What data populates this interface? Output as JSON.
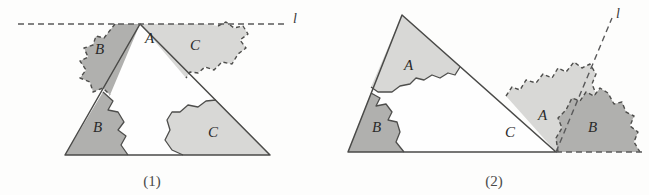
{
  "figure": {
    "background_color": "#fdfdfc",
    "shade_dark": "#b0b0ae",
    "shade_light": "#d8d8d6",
    "stroke_color": "#4a4a48",
    "panels": [
      {
        "id": "panel-1",
        "caption": "(1)",
        "line_label": "l",
        "line_orientation": "horizontal",
        "labels": [
          {
            "text": "A",
            "role": "apex-interior-label"
          },
          {
            "text": "B",
            "role": "upper-left-region-label"
          },
          {
            "text": "C",
            "role": "upper-right-region-label"
          },
          {
            "text": "B",
            "role": "lower-left-region-label"
          },
          {
            "text": "C",
            "role": "lower-right-region-label"
          }
        ]
      },
      {
        "id": "panel-2",
        "caption": "(2)",
        "line_label": "l",
        "line_orientation": "oblique",
        "labels": [
          {
            "text": "A",
            "role": "upper-left-region-label"
          },
          {
            "text": "B",
            "role": "lower-left-region-label"
          },
          {
            "text": "C",
            "role": "interior-label"
          },
          {
            "text": "A",
            "role": "right-cloud-light-label"
          },
          {
            "text": "B",
            "role": "right-cloud-dark-label"
          }
        ]
      }
    ]
  }
}
